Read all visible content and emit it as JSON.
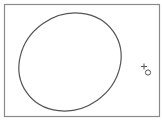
{
  "canvas": {
    "background": "#ffffff",
    "frame": {
      "x": 4,
      "y": 4,
      "width": 156,
      "height": 113,
      "stroke": "#8a8a8a"
    },
    "ellipse": {
      "cx": 70,
      "cy": 62,
      "rx": 54,
      "ry": 50,
      "rotation": -30,
      "stroke": "#555555"
    },
    "cursor": {
      "type": "crosshair-with-circle",
      "x": 144,
      "y": 68,
      "stroke": "#555555"
    }
  }
}
